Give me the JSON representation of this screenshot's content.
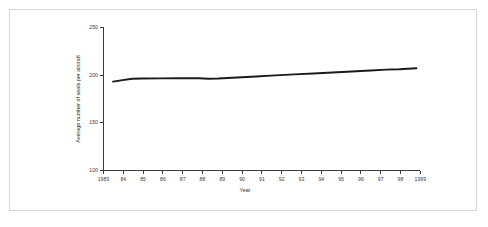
{
  "figure": {
    "background_color": "#ffffff",
    "frame_color": "#d8d8d8",
    "line_color": "#1a1a1a",
    "axis_color": "#3a3a3a"
  },
  "chart_data": {
    "type": "line",
    "title": "",
    "xlabel": "Year",
    "ylabel": "Average number of seats per aircraft",
    "xlim": [
      1983,
      1999.6
    ],
    "ylim": [
      100,
      250
    ],
    "yticks": [
      100,
      150,
      200,
      250
    ],
    "ytick_labels": [
      "100",
      "150",
      "200",
      "250"
    ],
    "xticks": [
      1983,
      1984,
      1985,
      1986,
      1987,
      1988,
      1989,
      1990,
      1991,
      1992,
      1993,
      1994,
      1995,
      1996,
      1997,
      1998,
      1999
    ],
    "xtick_labels": [
      "1983",
      "84",
      "85",
      "86",
      "87",
      "88",
      "89",
      "90",
      "91",
      "92",
      "93",
      "94",
      "95",
      "96",
      "97",
      "98",
      "1999"
    ],
    "grid": false,
    "legend": null,
    "x": [
      1983.5,
      1984,
      1984.5,
      1985,
      1986,
      1987,
      1988,
      1988.5,
      1989,
      1990,
      1991,
      1992,
      1993,
      1994,
      1995,
      1996,
      1997,
      1997.8,
      1998.5,
      1999.4
    ],
    "values": [
      193.2,
      194.8,
      196.3,
      196.5,
      196.6,
      196.7,
      196.8,
      196.3,
      196.5,
      197.5,
      198.6,
      199.8,
      200.8,
      201.8,
      202.8,
      203.8,
      204.9,
      205.8,
      206.2,
      207.2
    ],
    "series": [
      {
        "name": "Average number of seats per aircraft",
        "values": [
          193.2,
          194.8,
          196.3,
          196.5,
          196.6,
          196.7,
          196.8,
          196.3,
          196.5,
          197.5,
          198.6,
          199.8,
          200.8,
          201.8,
          202.8,
          203.8,
          204.9,
          205.8,
          206.2,
          207.2
        ]
      }
    ]
  }
}
